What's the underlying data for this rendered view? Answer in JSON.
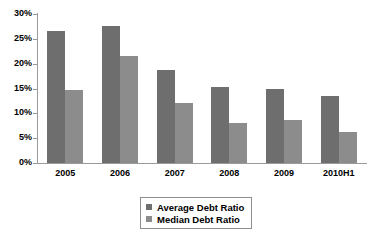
{
  "chart_data": {
    "type": "bar",
    "title": "",
    "subtitle": "",
    "xlabel": "",
    "ylabel": "",
    "categories": [
      "2005",
      "2006",
      "2007",
      "2008",
      "2009",
      "2010H1"
    ],
    "series": [
      {
        "name": "Average Debt Ratio",
        "color": "#6e6e6e",
        "values": [
          26.5,
          27.5,
          18.7,
          15.3,
          14.9,
          13.5
        ]
      },
      {
        "name": "Median Debt Ratio",
        "color": "#8c8c8c",
        "values": [
          14.8,
          21.5,
          12.0,
          8.0,
          8.6,
          6.3
        ]
      }
    ],
    "ylim": [
      0,
      30
    ],
    "ytick_values": [
      0,
      5,
      10,
      15,
      20,
      25,
      30
    ],
    "ytick_labels": [
      "0%",
      "5%",
      "10%",
      "15%",
      "20%",
      "25%",
      "30%"
    ],
    "ytick_suffix": "%",
    "grid": false,
    "legend_position": "bottom-center",
    "legend_entries": [
      "Average Debt Ratio",
      "Median Debt Ratio"
    ],
    "axis_color": "#9a9a9a",
    "background": "#ffffff"
  }
}
